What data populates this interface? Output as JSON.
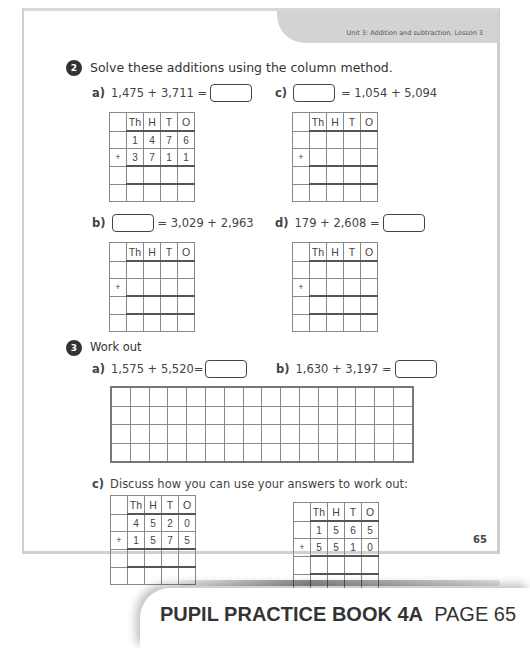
{
  "header": {
    "unit_label": "Unit 3: Addition and subtraction, Lesson 3"
  },
  "question2": {
    "number": "2",
    "title": "Solve these additions using the column method.",
    "parts": [
      {
        "label": "a)",
        "expr_before": "1,475 + 3,711 =",
        "expr_after": ""
      },
      {
        "label": "c)",
        "expr_before": "",
        "expr_after": "= 1,054 + 5,094"
      },
      {
        "label": "b)",
        "expr_before": "",
        "expr_after": "= 3,029 + 2,963"
      },
      {
        "label": "d)",
        "expr_before": "179 + 2,608 =",
        "expr_after": ""
      }
    ],
    "grid_headers": [
      "Th",
      "H",
      "T",
      "O"
    ],
    "grid_a": {
      "row1": [
        "1",
        "4",
        "7",
        "6"
      ],
      "row2_sign": "+",
      "row2": [
        "3",
        "7",
        "1",
        "1"
      ]
    },
    "plus_sign": "+"
  },
  "question3": {
    "number": "3",
    "title": "Work out",
    "part_a": {
      "label": "a)",
      "expr": "1,575 + 5,520="
    },
    "part_b": {
      "label": "b)",
      "expr": "1,630 + 3,197 ="
    },
    "grid": {
      "columns": 16,
      "rows": 4
    },
    "part_c": {
      "label": "c)",
      "text": "Discuss how you can use your answers to work out:",
      "grid_left": {
        "row1": [
          "4",
          "5",
          "2",
          "0"
        ],
        "sign": "+",
        "row2": [
          "1",
          "5",
          "7",
          "5"
        ]
      },
      "grid_right": {
        "row1": [
          "1",
          "5",
          "6",
          "5"
        ],
        "sign": "+",
        "row2": [
          "5",
          "5",
          "1",
          "0"
        ]
      }
    }
  },
  "page_number": "65",
  "footer": {
    "book": "PUPIL PRACTICE BOOK 4A",
    "page": "PAGE 65"
  }
}
